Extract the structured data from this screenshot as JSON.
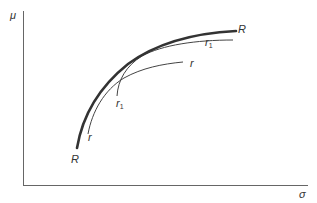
{
  "axes": {
    "y_label": "μ",
    "x_label": "σ",
    "color": "#555555"
  },
  "curves": {
    "R": {
      "label_top": "R",
      "label_bottom": "R",
      "color": "#333333"
    },
    "r": {
      "label_top": "r",
      "label_bottom": "r",
      "color": "#444444"
    },
    "r1": {
      "label_top": "r",
      "label_top_sub": "1",
      "label_bottom": "r",
      "label_bottom_sub": "1",
      "color": "#444444"
    }
  }
}
